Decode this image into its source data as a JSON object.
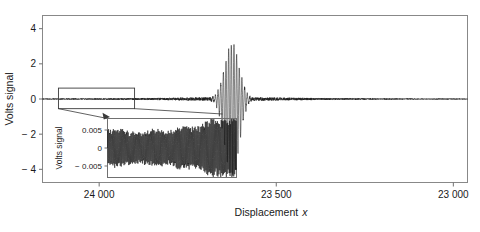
{
  "figure": {
    "background": "#ffffff",
    "line_color": "#1a1a1a",
    "axis_color": "#707070",
    "text_color": "#1a1a1a"
  },
  "chart_data": {
    "type": "line",
    "title": "",
    "xlabel": "Displacement x",
    "ylabel": "Volts signal",
    "xlim": [
      24160,
      22960
    ],
    "ylim": [
      -4.75,
      4.75
    ],
    "x_reversed": true,
    "grid": false,
    "legend": null,
    "xticks": [
      24000,
      23500,
      23000
    ],
    "xticklabels": [
      "24 000",
      "23 500",
      "23 000"
    ],
    "yticks": [
      -4,
      -2,
      0,
      2,
      4
    ],
    "yticklabels": [
      "-4",
      "-2",
      "0",
      "2",
      "4"
    ],
    "series": [
      {
        "name": "volts signal",
        "description": "ultrasonic A-scan: low-amplitude noise baseline with a single large echo burst",
        "noise_amplitude": 0.045,
        "burst": {
          "center_x": 23625,
          "peak_positive": 3.25,
          "peak_negative": -4.6,
          "envelope_width_x": 70,
          "carrier_period_x": 7.5
        }
      }
    ],
    "annotation_box": {
      "name": "zoom-region-box",
      "x_range": [
        24115,
        23900
      ],
      "y_range": [
        -0.55,
        0.62
      ]
    },
    "inset": {
      "type": "line",
      "ylabel": "Volts signal",
      "yticks": [
        -0.005,
        0,
        0.005
      ],
      "yticklabels": [
        "-0.005",
        "0",
        "0.005"
      ],
      "ylim": [
        -0.0082,
        0.0082
      ],
      "xlim": [
        24115,
        23900
      ],
      "grid": false,
      "series": [
        {
          "name": "zoomed noise",
          "description": "high-frequency oscillation with amplitude beating, growing toward the right",
          "amplitude_min": 0.0022,
          "amplitude_max": 0.0072,
          "carrier_period_x": 1.55
        }
      ]
    }
  }
}
